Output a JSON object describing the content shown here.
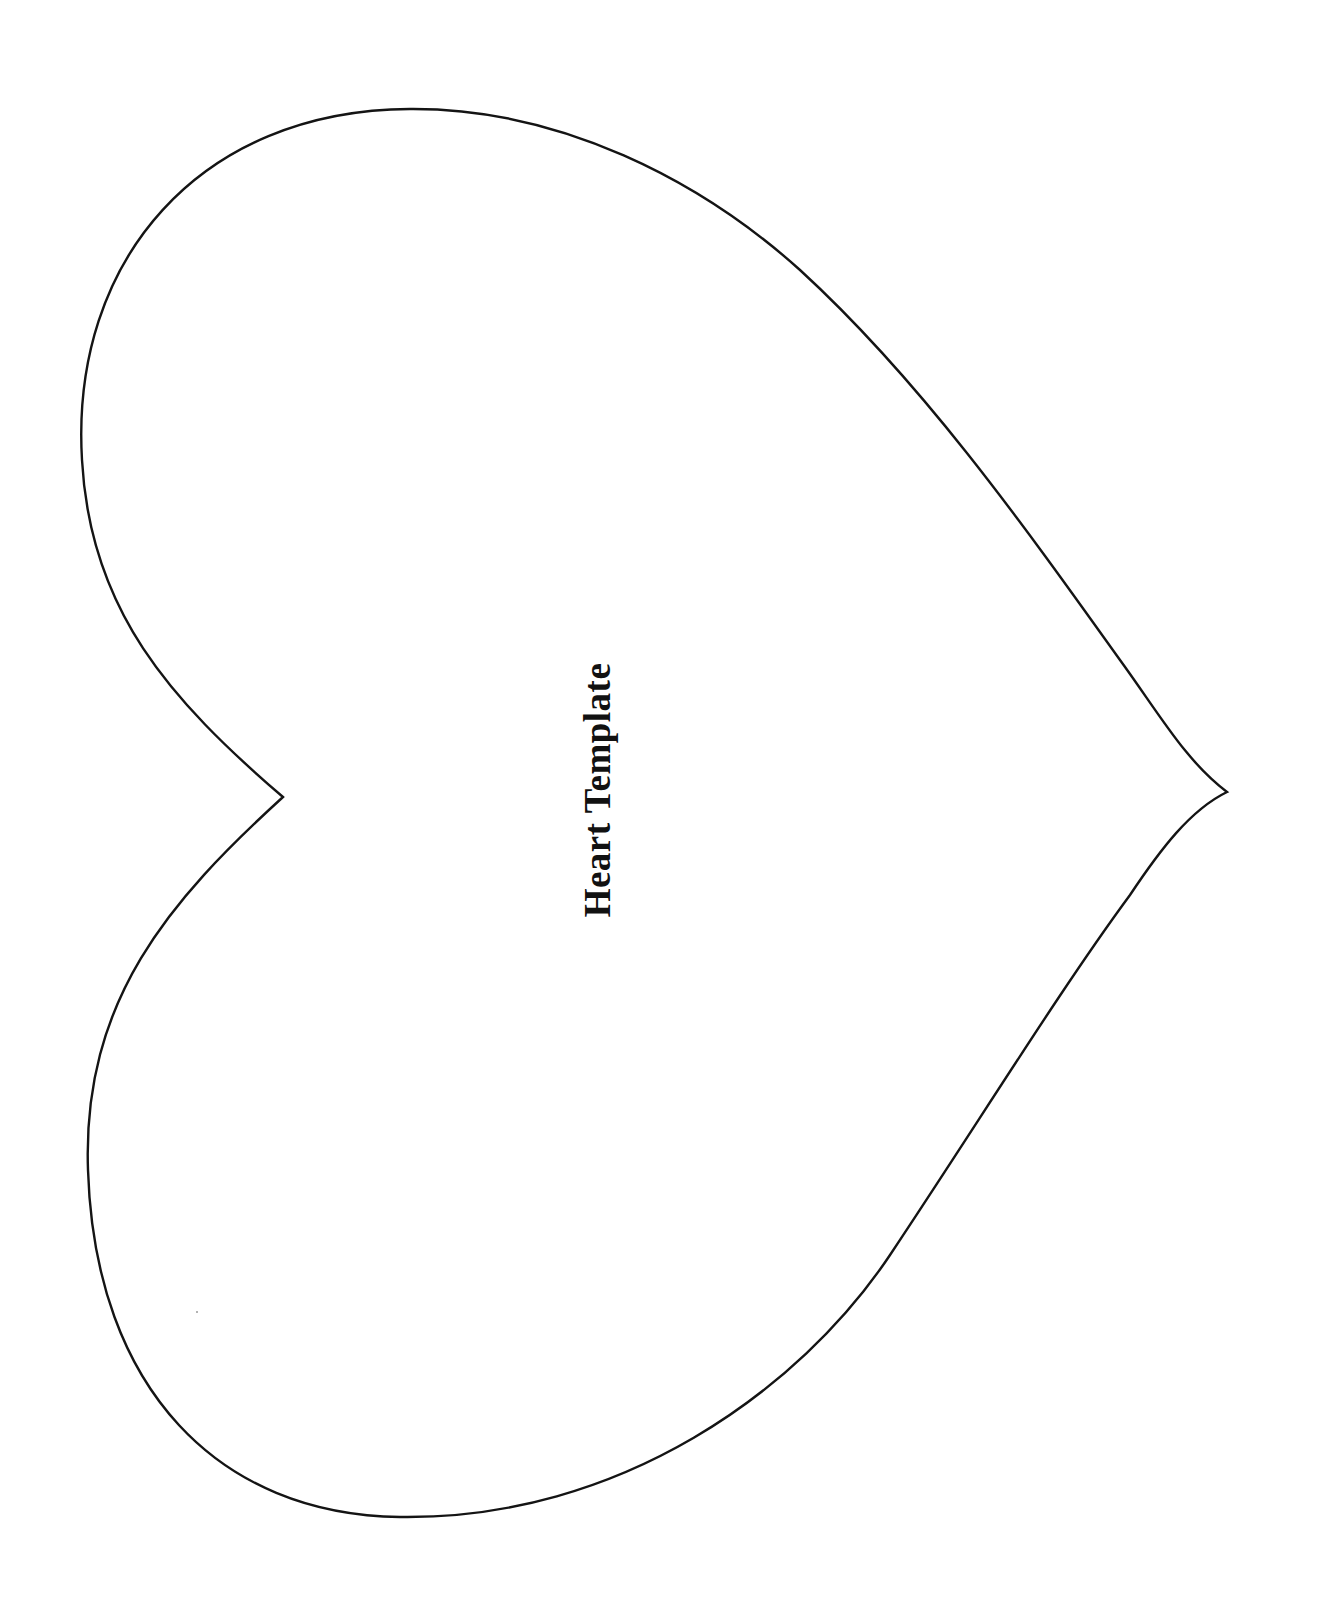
{
  "document": {
    "title": "Heart Template",
    "title_orientation": "rotated -90deg (reads bottom-to-top)"
  },
  "shape": {
    "name": "heart-outline",
    "orientation": "rotated 90deg clockwise (point facing right)",
    "stroke_color": "#141414",
    "background_color": "#ffffff",
    "notch_point": [
      283,
      797
    ],
    "tip_point": [
      1227,
      792
    ]
  }
}
